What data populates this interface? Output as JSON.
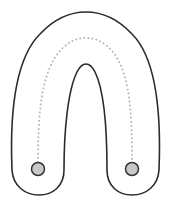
{
  "diagram": {
    "type": "u-shaped tube with dotted centerline and two end circles",
    "colors": {
      "background": "#ffffff",
      "outline": "#2b2b2b",
      "dotted_path": "#b8b8b8",
      "circle_fill": "#c8c8c8",
      "circle_stroke": "#333333"
    },
    "elements": [
      {
        "name": "tube-outline",
        "shape": "inverted-U"
      },
      {
        "name": "centerline-path",
        "style": "dotted"
      },
      {
        "name": "left-end-circle"
      },
      {
        "name": "right-end-circle"
      }
    ]
  }
}
